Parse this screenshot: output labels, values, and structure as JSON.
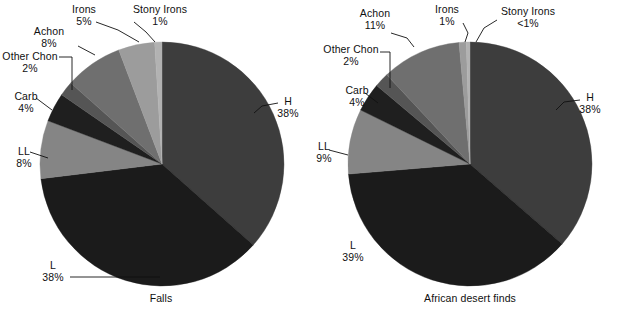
{
  "figure": {
    "background": "#ffffff",
    "text_color": "#101010"
  },
  "chart_data": [
    {
      "type": "pie",
      "title": "Falls",
      "caption": "Falls",
      "categories": [
        "H",
        "L",
        "LL",
        "Carb",
        "Other Chon",
        "Achon",
        "Irons",
        "Stony Irons"
      ],
      "values": [
        38,
        38,
        8,
        4,
        2,
        8,
        5,
        1
      ],
      "value_labels": [
        "38%",
        "38%",
        "8%",
        "4%",
        "2%",
        "8%",
        "5%",
        "1%"
      ],
      "colors": [
        "#3d3d3d",
        "#1b1b1b",
        "#858585",
        "#1f1f1f",
        "#555555",
        "#6f6f6f",
        "#9c9c9c",
        "#b2b2b2"
      ],
      "start_angle_deg": 0,
      "direction": "clockwise",
      "legend": "none",
      "grid": false,
      "xlabel": "",
      "ylabel": ""
    },
    {
      "type": "pie",
      "title": "African desert finds",
      "caption": "African desert finds",
      "categories": [
        "H",
        "L",
        "LL",
        "Carb",
        "Other Chon",
        "Achon",
        "Irons",
        "Stony Irons"
      ],
      "values": [
        38,
        39,
        9,
        4,
        2,
        11,
        1,
        0.5
      ],
      "value_labels": [
        "38%",
        "39%",
        "9%",
        "4%",
        "2%",
        "11%",
        "1%",
        "<1%"
      ],
      "colors": [
        "#3d3d3d",
        "#1b1b1b",
        "#858585",
        "#1f1f1f",
        "#555555",
        "#6f6f6f",
        "#9c9c9c",
        "#b2b2b2"
      ],
      "start_angle_deg": 0,
      "direction": "clockwise",
      "legend": "none",
      "grid": false,
      "xlabel": "",
      "ylabel": ""
    }
  ],
  "charts": [
    {
      "id": "falls",
      "caption": "Falls",
      "caption_pos": {
        "x": 155,
        "y": 296
      },
      "center": {
        "cx": 162,
        "cy": 164,
        "r": 122
      },
      "slices": [
        {
          "name": "H",
          "pct_label": "38%",
          "value": 38,
          "color": "#3d3d3d"
        },
        {
          "name": "L",
          "pct_label": "38%",
          "value": 38,
          "color": "#1b1b1b"
        },
        {
          "name": "LL",
          "pct_label": "8%",
          "value": 8,
          "color": "#858585"
        },
        {
          "name": "Carb",
          "pct_label": "4%",
          "value": 4,
          "color": "#1f1f1f"
        },
        {
          "name": "Other Chon",
          "pct_label": "2%",
          "value": 2,
          "color": "#555555"
        },
        {
          "name": "Achon",
          "pct_label": "8%",
          "value": 8,
          "color": "#6f6f6f"
        },
        {
          "name": "Irons",
          "pct_label": "5%",
          "value": 5,
          "color": "#9c9c9c"
        },
        {
          "name": "Stony Irons",
          "pct_label": "1%",
          "value": 1,
          "color": "#b2b2b2"
        }
      ],
      "labels": [
        {
          "key": "irons",
          "name": "Irons",
          "pct": "5%",
          "x": 84,
          "y": 4,
          "align": "center"
        },
        {
          "key": "stonyirons",
          "name": "Stony Irons",
          "pct": "1%",
          "x": 126,
          "y": 4,
          "align": "center"
        },
        {
          "key": "achon",
          "name": "Achon",
          "pct": "8%",
          "x": 49,
          "y": 26,
          "align": "center"
        },
        {
          "key": "otherchon",
          "name": "Other Chon",
          "pct": "2%",
          "x": 1,
          "y": 51,
          "align": "center"
        },
        {
          "key": "carb",
          "name": "Carb",
          "pct": "4%",
          "x": 9,
          "y": 91,
          "align": "center"
        },
        {
          "key": "ll",
          "name": "LL",
          "pct": "8%",
          "x": 11,
          "y": 146,
          "align": "center"
        },
        {
          "key": "h",
          "name": "H",
          "pct": "38%",
          "x": 283,
          "y": 96,
          "align": "center"
        },
        {
          "key": "l",
          "name": "L",
          "pct": "38%",
          "x": 51,
          "y": 260,
          "align": "center"
        }
      ]
    },
    {
      "id": "african-desert-finds",
      "caption": "African desert finds",
      "caption_pos": {
        "x": 464,
        "y": 296
      },
      "center": {
        "cx": 470,
        "cy": 164,
        "r": 122
      },
      "slices": [
        {
          "name": "H",
          "pct_label": "38%",
          "value": 38,
          "color": "#3d3d3d"
        },
        {
          "name": "L",
          "pct_label": "39%",
          "value": 39,
          "color": "#1b1b1b"
        },
        {
          "name": "LL",
          "pct_label": "9%",
          "value": 9,
          "color": "#858585"
        },
        {
          "name": "Carb",
          "pct_label": "4%",
          "value": 4,
          "color": "#1f1f1f"
        },
        {
          "name": "Other Chon",
          "pct_label": "2%",
          "value": 2,
          "color": "#555555"
        },
        {
          "name": "Achon",
          "pct_label": "11%",
          "value": 11,
          "color": "#6f6f6f"
        },
        {
          "name": "Irons",
          "pct_label": "1%",
          "value": 1,
          "color": "#9c9c9c"
        },
        {
          "name": "Stony Irons",
          "pct_label": "<1%",
          "value": 0.5,
          "color": "#b2b2b2"
        }
      ],
      "labels": [
        {
          "key": "achon",
          "name": "Achon",
          "pct": "11%",
          "x": 63,
          "y": 8,
          "align": "center"
        },
        {
          "key": "irons",
          "name": "Irons",
          "pct": "1%",
          "x": 135,
          "y": 4,
          "align": "center"
        },
        {
          "key": "stonyirons",
          "name": "Stony Irons",
          "pct": "<1%",
          "x": 193,
          "y": 6,
          "align": "center"
        },
        {
          "key": "otherchon",
          "name": "Other Chon",
          "pct": "2%",
          "x": 12,
          "y": 44,
          "align": "center"
        },
        {
          "key": "carb",
          "name": "Carb",
          "pct": "4%",
          "x": 27,
          "y": 85,
          "align": "center"
        },
        {
          "key": "ll",
          "name": "LL",
          "pct": "9%",
          "x": -4,
          "y": 141,
          "align": "center"
        },
        {
          "key": "h",
          "name": "H",
          "pct": "38%",
          "x": 274,
          "y": 92,
          "align": "center"
        },
        {
          "key": "l",
          "name": "L",
          "pct": "39%",
          "x": 39,
          "y": 240,
          "align": "center"
        }
      ]
    }
  ]
}
